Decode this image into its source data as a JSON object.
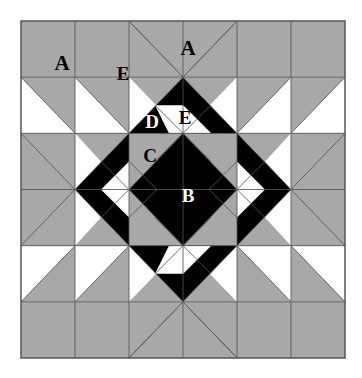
{
  "image": {
    "kind": "quilt-block-diagram",
    "title": "Pieced quilt block with lettered patch labels",
    "width": 362,
    "height": 378
  },
  "palette": {
    "background": "#ffffff",
    "light": "#ffffff",
    "medium": "#a8a8a8",
    "dark": "#000000",
    "outline": "#555555",
    "label_dark": "#000000",
    "label_light": "#ffffff"
  },
  "block": {
    "x": 21,
    "y": 21,
    "width": 324,
    "height": 337,
    "grid_columns": 6,
    "grid_rows": 6,
    "cell_width": 54,
    "cell_height": 56.1667,
    "symmetry": "four-fold mirror (horizontal and vertical)",
    "border_color": "#555555"
  },
  "labels": [
    {
      "id": "label-a-left",
      "text": "A",
      "x": 62,
      "y": 63,
      "size": 21,
      "tone": "dark"
    },
    {
      "id": "label-a-top",
      "text": "A",
      "x": 188,
      "y": 48,
      "size": 21,
      "tone": "dark"
    },
    {
      "id": "label-e-upper",
      "text": "E",
      "x": 123,
      "y": 73,
      "size": 19,
      "tone": "dark"
    },
    {
      "id": "label-e-inner",
      "text": "E",
      "x": 185,
      "y": 117,
      "size": 19,
      "tone": "dark"
    },
    {
      "id": "label-d",
      "text": "D",
      "x": 152,
      "y": 121,
      "size": 19,
      "tone": "light"
    },
    {
      "id": "label-c",
      "text": "C",
      "x": 150,
      "y": 155,
      "size": 19,
      "tone": "dark"
    },
    {
      "id": "label-b",
      "text": "B",
      "x": 188,
      "y": 195,
      "size": 19,
      "tone": "light"
    }
  ],
  "legend": {
    "A": "Large plain square patch (medium value)",
    "B": "Center on-point square (dark value)",
    "C": "Corner triangle of center square-in-square unit (medium value)",
    "D": "Dark background triangle of flying-geese unit",
    "E": "Light triangle patch (flying-geese / square-in-square point)"
  }
}
